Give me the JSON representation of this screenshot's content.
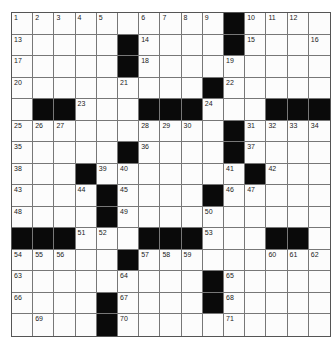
{
  "puzzle": {
    "rows": 15,
    "cols": 15,
    "grid": [
      [
        "1",
        "2",
        "3",
        "4",
        "5",
        "",
        "6",
        "7",
        "8",
        "9",
        "#",
        "10",
        "11",
        "12",
        ""
      ],
      [
        "13",
        "",
        "",
        "",
        "",
        "#",
        "14",
        "",
        "",
        "",
        "#",
        "15",
        "",
        "",
        "16"
      ],
      [
        "17",
        "",
        "",
        "",
        "",
        "#",
        "18",
        "",
        "",
        "",
        "19",
        "",
        "",
        "",
        ""
      ],
      [
        "20",
        "",
        "",
        "",
        "",
        "21",
        "",
        "",
        "",
        "#",
        "22",
        "",
        "",
        "",
        ""
      ],
      [
        "",
        "#",
        "#",
        "23",
        "",
        "",
        "#",
        "#",
        "#",
        "24",
        "",
        "",
        "#",
        "#",
        "#"
      ],
      [
        "25",
        "26",
        "27",
        "",
        "",
        "",
        "28",
        "29",
        "30",
        "",
        "#",
        "31",
        "32",
        "33",
        "34"
      ],
      [
        "35",
        "",
        "",
        "",
        "",
        "#",
        "36",
        "",
        "",
        "",
        "#",
        "37",
        "",
        "",
        ""
      ],
      [
        "38",
        "",
        "",
        "#",
        "39",
        "40",
        "",
        "",
        "",
        "",
        "41",
        "#",
        "42",
        "",
        ""
      ],
      [
        "43",
        "",
        "",
        "44",
        "#",
        "45",
        "",
        "",
        "",
        "#",
        "46",
        "47",
        "",
        "",
        ""
      ],
      [
        "48",
        "",
        "",
        "",
        "#",
        "49",
        "",
        "",
        "",
        "50",
        "",
        "",
        "",
        "",
        ""
      ],
      [
        "#",
        "#",
        "#",
        "51",
        "52",
        "",
        "#",
        "#",
        "#",
        "53",
        "",
        "",
        "#",
        "#",
        ""
      ],
      [
        "54",
        "55",
        "56",
        "",
        "",
        "#",
        "57",
        "58",
        "59",
        "",
        "",
        "",
        "60",
        "61",
        "62"
      ],
      [
        "63",
        "",
        "",
        "",
        "",
        "64",
        "",
        "",
        "",
        "#",
        "65",
        "",
        "",
        "",
        ""
      ],
      [
        "66",
        "",
        "",
        "",
        "#",
        "67",
        "",
        "",
        "",
        "#",
        "68",
        "",
        "",
        "",
        ""
      ],
      [
        "",
        "69",
        "",
        "",
        "#",
        "70",
        "",
        "",
        "",
        "",
        "71",
        "",
        "",
        "",
        ""
      ]
    ]
  },
  "colors": {
    "block": "#0a0a0a",
    "cell": "#fcfcfc",
    "line": "#777777"
  }
}
